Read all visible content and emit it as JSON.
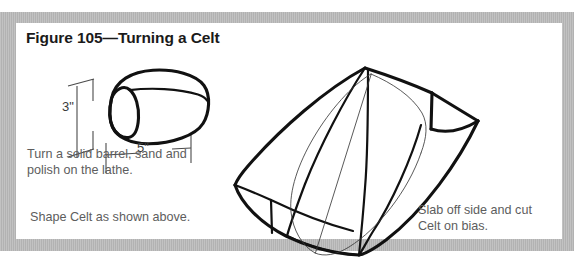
{
  "figure": {
    "title": "Figure 105—Turning a Celt",
    "title_number": "105",
    "title_subject": "Turning a Celt"
  },
  "captions": {
    "lathe": "Turn a solid barrel, sand and\npolish on the lathe.",
    "shape": "Shape Celt as shown above.",
    "slab": "Slab off side and cut\nCelt on bias."
  },
  "dimensions": {
    "height_label": "3\"",
    "width_label": "5\"",
    "height_value": 3,
    "width_value": 5,
    "units": "inches"
  },
  "drawings": {
    "barrel": {
      "name": "solid-turned-barrel",
      "description": "Rounded barrel blank shown in perspective with elliptical end face"
    },
    "celt": {
      "name": "finished-celt",
      "description": "Celt with slabbed-off side and bias-cut end, drawn in perspective"
    }
  },
  "colors": {
    "page_background": "#ffffff",
    "mat": "#b9b9b9",
    "card": "#ffffff",
    "ink": "#111111",
    "title_text": "#1a1a1a",
    "caption_text": "#5d5d5d",
    "dimension_text": "#3a3a3a",
    "dimension_line": "#4a4a4a"
  }
}
